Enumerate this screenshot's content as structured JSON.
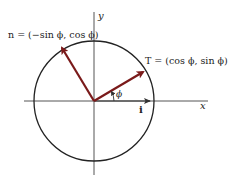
{
  "diagram": {
    "axes": {
      "x_label": "x",
      "y_label": "y"
    },
    "vectors": {
      "T": {
        "label": "T = (cos ϕ, sin ϕ)",
        "color": "#7a1a1a"
      },
      "n": {
        "label": "n = (−sin ϕ, cos ϕ)",
        "color": "#7a1a1a"
      },
      "i": {
        "label": "i",
        "color": "#333333"
      }
    },
    "angle_label": "ϕ",
    "colors": {
      "circle": "#222222",
      "axes": "#555555",
      "vector": "#7a1a1a"
    }
  }
}
